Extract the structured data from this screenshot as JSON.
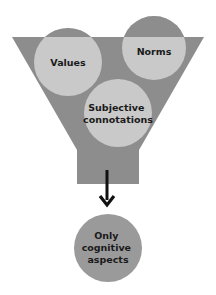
{
  "diagram": {
    "type": "funnel",
    "colors": {
      "funnel": "#8d8d8d",
      "input_circle": "#c9c9c9",
      "output_circle": "#9a9a9a",
      "arrow": "#111111",
      "text": "#1a1a1a"
    },
    "inputs": [
      {
        "label_lines": [
          "Values"
        ]
      },
      {
        "label_lines": [
          "Norms"
        ]
      },
      {
        "label_lines": [
          "Subjective",
          "connotations"
        ]
      }
    ],
    "output": {
      "label_lines": [
        "Only",
        "cognitive",
        "aspects"
      ]
    }
  }
}
